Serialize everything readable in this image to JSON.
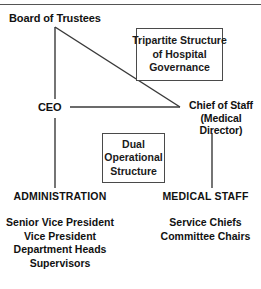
{
  "diagram": {
    "type": "organizational-chart",
    "title_text_present": false,
    "top_rule": true,
    "nodes": {
      "board": "Board of Trustees",
      "ceo": "CEO",
      "chief_of_staff_line1": "Chief of Staff",
      "chief_of_staff_line2": "(Medical Director)"
    },
    "callouts": {
      "tripartite": {
        "line1": "Tripartite Structure",
        "line2": "of Hospital",
        "line3": "Governance"
      },
      "dual": {
        "line1": "Dual",
        "line2": "Operational",
        "line3": "Structure"
      }
    },
    "columns": [
      {
        "heading": "ADMINISTRATION",
        "items": [
          "Senior Vice President",
          "Vice President",
          "Department Heads",
          "Supervisors"
        ]
      },
      {
        "heading": "MEDICAL STAFF",
        "items": [
          "Service Chiefs",
          "Committee Chairs"
        ]
      }
    ],
    "colors": {
      "line": "#3a3a3a",
      "box_border": "#4a4a4a",
      "text": "#111111",
      "background": "#ffffff",
      "rule": "#555555"
    }
  }
}
